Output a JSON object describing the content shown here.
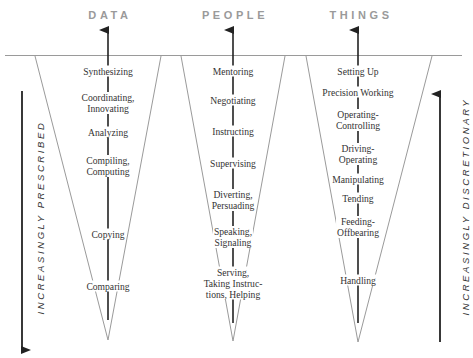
{
  "diagram": {
    "columns": [
      {
        "title": "DATA",
        "steps": [
          "Synthesizing",
          "Coordinating,\nInnovating",
          "Analyzing",
          "Compiling,\nComputing",
          "Copying",
          "Comparing"
        ]
      },
      {
        "title": "PEOPLE",
        "steps": [
          "Mentoring",
          "Negotiating",
          "Instructing",
          "Supervising",
          "Diverting,\nPersuading",
          "Speaking,\nSignaling",
          "Serving,\nTaking Instruc-\ntions, Helping"
        ]
      },
      {
        "title": "THINGS",
        "steps": [
          "Setting Up",
          "Precision Working",
          "Operating-\nControlling",
          "Driving-\nOperating",
          "Manipulating",
          "Tending",
          "Feeding-\nOffbearing",
          "Handling"
        ]
      }
    ],
    "left_axis": {
      "label": "INCREASINGLY PRESCRIBED",
      "direction": "down"
    },
    "right_axis": {
      "label": "INCREASINGLY DISCRETIONARY",
      "direction": "up"
    },
    "colors": {
      "title": "#9a9a9a",
      "triangle_stroke": "#9a9a9a",
      "arrow": "#222222",
      "text": "#333333"
    }
  }
}
